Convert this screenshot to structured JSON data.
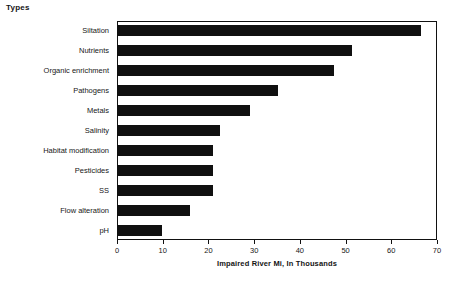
{
  "heading": "Types",
  "chart_data": {
    "type": "bar",
    "orientation": "horizontal",
    "title": "Types",
    "xlabel": "Impaired River Mi, In Thousands",
    "ylabel": "Types",
    "xlim": [
      0,
      70
    ],
    "xticks": [
      0,
      10,
      20,
      30,
      40,
      50,
      60,
      70
    ],
    "xtick_labels": [
      "0",
      "10",
      "20",
      "30",
      "40",
      "50",
      "60",
      "70"
    ],
    "grid": false,
    "legend": null,
    "bar_color": "#101010",
    "frame_color": "#111111",
    "background": "#ffffff",
    "categories": [
      "Siltation",
      "Nutrients",
      "Organic enrichment",
      "Pathogens",
      "Metals",
      "Salinity",
      "Habitat modification",
      "Pesticides",
      "SS",
      "Flow alteration",
      "pH"
    ],
    "values": [
      66.5,
      51.5,
      47.5,
      35.3,
      29.0,
      22.5,
      21.0,
      21.0,
      21.0,
      16.0,
      9.8
    ]
  }
}
